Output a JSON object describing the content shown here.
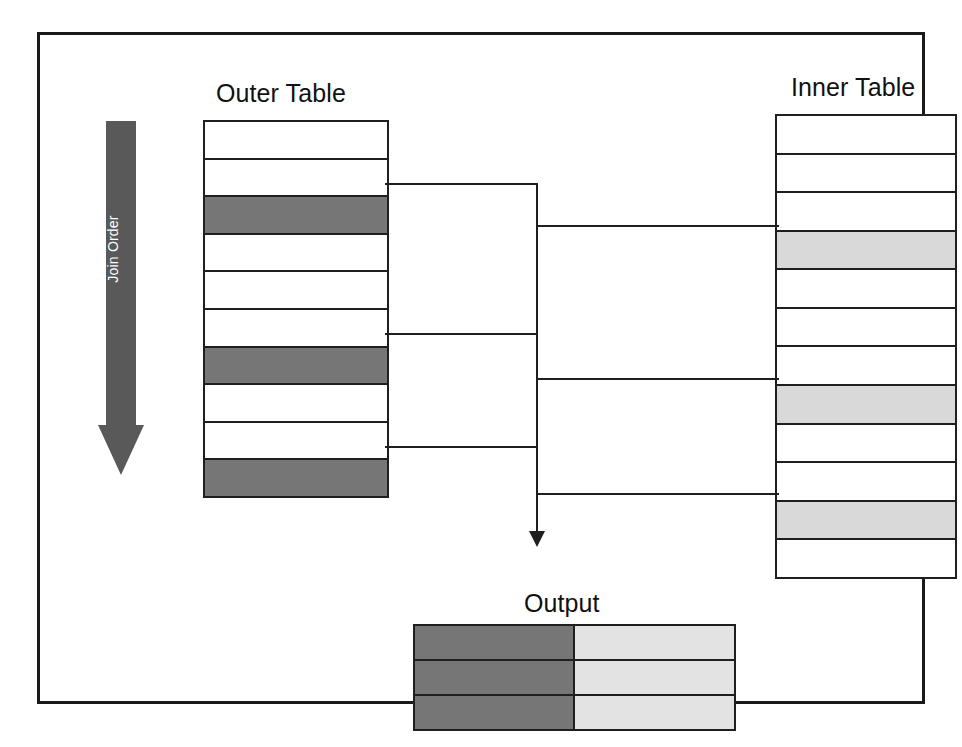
{
  "figure": {
    "kind": "nested-loop-join-diagram",
    "frame_border_color": "#1a1a1a",
    "background": "#ffffff"
  },
  "join_order": {
    "label": "Join Order",
    "direction": "downward",
    "color": "#595959",
    "text_color": "#ffffff"
  },
  "outer_table": {
    "title": "Outer Table",
    "row_count": 10,
    "highlight_color": "#767676",
    "plain_color": "#ffffff",
    "rows": [
      {
        "index": 1,
        "state": "plain"
      },
      {
        "index": 2,
        "state": "plain"
      },
      {
        "index": 3,
        "state": "match"
      },
      {
        "index": 4,
        "state": "plain"
      },
      {
        "index": 5,
        "state": "plain"
      },
      {
        "index": 6,
        "state": "plain"
      },
      {
        "index": 7,
        "state": "match"
      },
      {
        "index": 8,
        "state": "plain"
      },
      {
        "index": 9,
        "state": "plain"
      },
      {
        "index": 10,
        "state": "match"
      }
    ],
    "matched_rows": [
      3,
      7,
      10
    ]
  },
  "inner_table": {
    "title": "Inner Table",
    "row_count": 12,
    "highlight_color": "#d9d9d9",
    "plain_color": "#ffffff",
    "rows": [
      {
        "index": 1,
        "state": "plain"
      },
      {
        "index": 2,
        "state": "plain"
      },
      {
        "index": 3,
        "state": "plain"
      },
      {
        "index": 4,
        "state": "match"
      },
      {
        "index": 5,
        "state": "plain"
      },
      {
        "index": 6,
        "state": "plain"
      },
      {
        "index": 7,
        "state": "plain"
      },
      {
        "index": 8,
        "state": "match"
      },
      {
        "index": 9,
        "state": "plain"
      },
      {
        "index": 10,
        "state": "plain"
      },
      {
        "index": 11,
        "state": "match"
      },
      {
        "index": 12,
        "state": "plain"
      }
    ],
    "matched_rows": [
      4,
      8,
      11
    ]
  },
  "output_table": {
    "title": "Output",
    "row_count": 3,
    "left_color": "#767676",
    "right_color": "#e3e3e3",
    "rows": [
      {
        "index": 1,
        "left": "outer-match",
        "right": "inner-match"
      },
      {
        "index": 2,
        "left": "outer-match",
        "right": "inner-match"
      },
      {
        "index": 3,
        "left": "outer-match",
        "right": "inner-match"
      }
    ]
  },
  "connectors": {
    "line_color": "#1f1f1f",
    "spine_x": 533,
    "outer_branches": [
      {
        "from_row": 3,
        "y": 180
      },
      {
        "from_row": 7,
        "y": 330
      },
      {
        "from_row": 10,
        "y": 443
      }
    ],
    "inner_branches": [
      {
        "to_row": 4,
        "y": 222
      },
      {
        "to_row": 8,
        "y": 375
      },
      {
        "to_row": 11,
        "y": 490
      }
    ],
    "arrow_target": "Output"
  }
}
